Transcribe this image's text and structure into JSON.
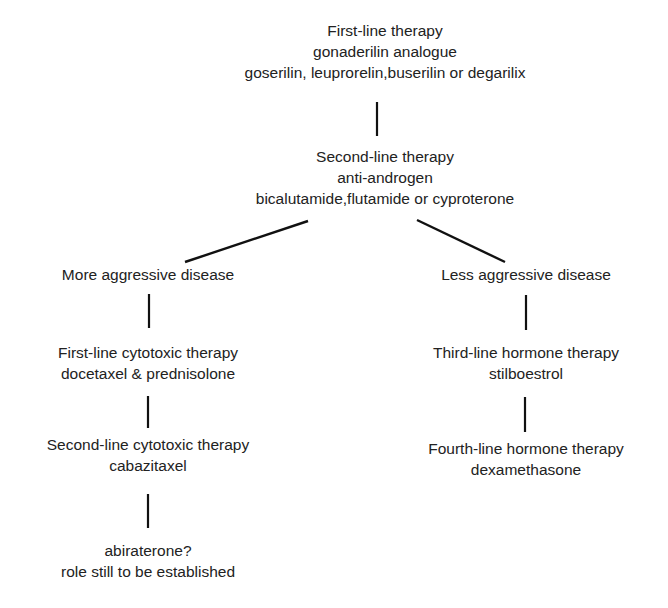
{
  "diagram": {
    "root": {
      "title": "First-line therapy",
      "subtitle": "gonaderilin analogue",
      "drugs": "goserilin, leuprorelin,buserilin or degarilix"
    },
    "second": {
      "title": "Second-line therapy",
      "subtitle": "anti-androgen",
      "drugs": "bicalutamide,flutamide or cyproterone"
    },
    "left_branch": {
      "label": "More aggressive disease",
      "step1": {
        "title": "First-line cytotoxic therapy",
        "drugs": "docetaxel & prednisolone"
      },
      "step2": {
        "title": "Second-line cytotoxic therapy",
        "drugs": "cabazitaxel"
      },
      "step3": {
        "title": "abiraterone?",
        "note": "role still to be established"
      }
    },
    "right_branch": {
      "label": "Less aggressive disease",
      "step1": {
        "title": "Third-line hormone therapy",
        "drugs": "stilboestrol"
      },
      "step2": {
        "title": "Fourth-line hormone therapy",
        "drugs": "dexamethasone"
      }
    }
  }
}
